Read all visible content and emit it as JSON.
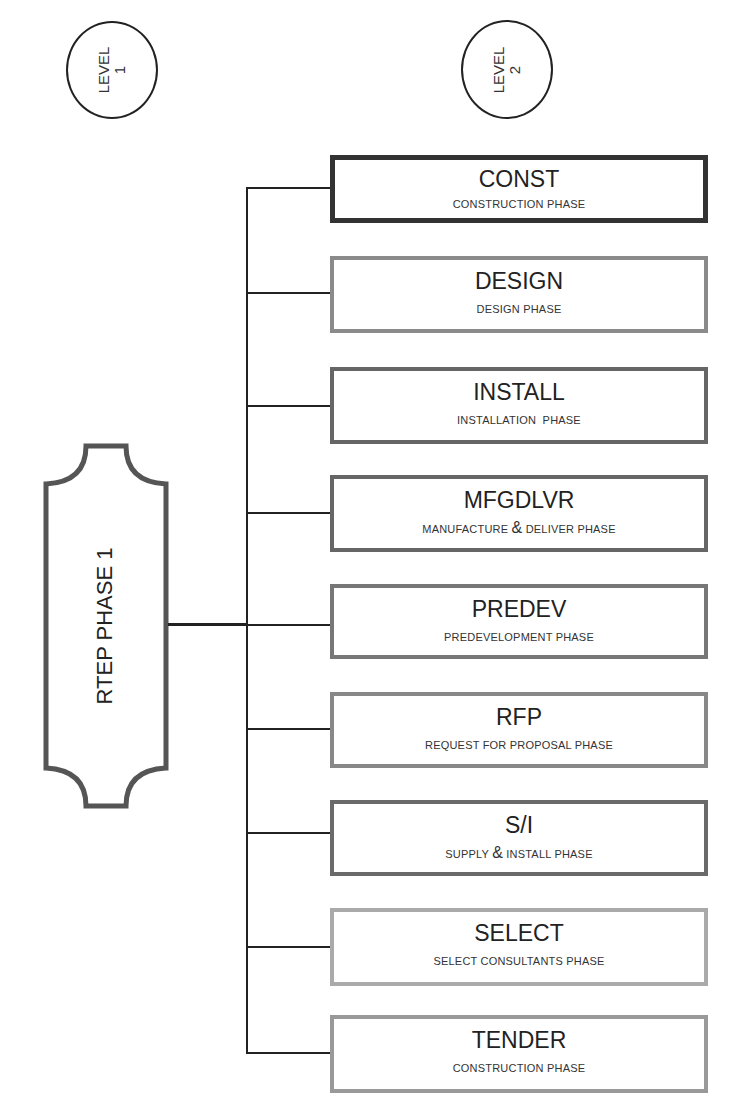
{
  "levels": [
    {
      "label": "LEVEL",
      "number": "1"
    },
    {
      "label": "LEVEL",
      "number": "2"
    }
  ],
  "root": {
    "label": "RTEP PHASE 1"
  },
  "phases": [
    {
      "code": "CONST",
      "desc_a": "CONSTRUCTION PHASE",
      "amp": "",
      "desc_b": "",
      "border": "#333333"
    },
    {
      "code": "DESIGN",
      "desc_a": "DESIGN PHASE",
      "amp": "",
      "desc_b": "",
      "border": "#8a8a8a"
    },
    {
      "code": "INSTALL",
      "desc_a": "INSTALLATION  PHASE",
      "amp": "",
      "desc_b": "",
      "border": "#666666"
    },
    {
      "code": "MFGDLVR",
      "desc_a": "MANUFACTURE ",
      "amp": "&",
      "desc_b": " DELIVER PHASE",
      "border": "#666666"
    },
    {
      "code": "PREDEV",
      "desc_a": "PREDEVELOPMENT PHASE",
      "amp": "",
      "desc_b": "",
      "border": "#777777"
    },
    {
      "code": "RFP",
      "desc_a": "REQUEST FOR PROPOSAL PHASE",
      "amp": "",
      "desc_b": "",
      "border": "#888888"
    },
    {
      "code": "S/I",
      "desc_a": "SUPPLY ",
      "amp": "&",
      "desc_b": " INSTALL PHASE",
      "border": "#6a6a6a"
    },
    {
      "code": "SELECT",
      "desc_a": "SELECT CONSULTANTS PHASE",
      "amp": "",
      "desc_b": "",
      "border": "#aaaaaa"
    },
    {
      "code": "TENDER",
      "desc_a": "CONSTRUCTION PHASE",
      "amp": "",
      "desc_b": "",
      "border": "#999999"
    }
  ]
}
